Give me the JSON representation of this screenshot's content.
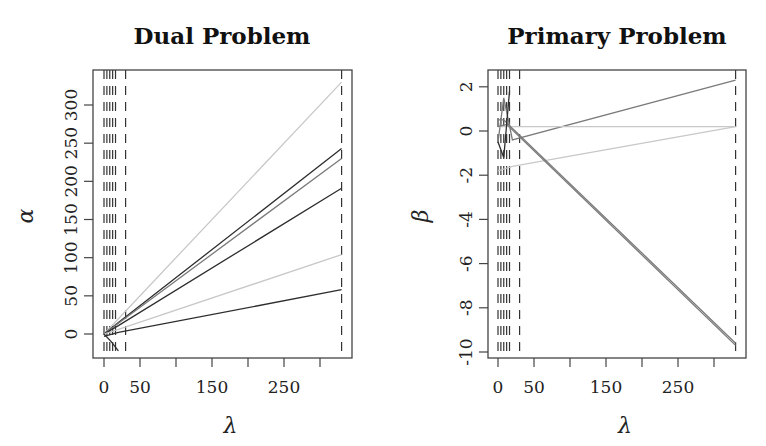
{
  "chart_data": [
    {
      "type": "line",
      "title": "Dual Problem",
      "xlabel": "λ",
      "ylabel": "α",
      "xlim": [
        -15,
        345
      ],
      "ylim": [
        -35,
        345
      ],
      "xticks": [
        0,
        50,
        100,
        150,
        200,
        250,
        300
      ],
      "xtick_labels": [
        "0",
        "50",
        "",
        "150",
        "",
        "250",
        ""
      ],
      "yticks": [
        0,
        50,
        100,
        150,
        200,
        250,
        300
      ],
      "ytick_labels": [
        "0",
        "50",
        "100",
        "150",
        "200",
        "250",
        "300"
      ],
      "grid": false,
      "vlines_dashed": [
        0,
        4,
        8,
        12,
        16,
        30,
        330
      ],
      "series": [
        {
          "name": "path1",
          "shade": "light",
          "x": [
            0,
            20,
            330
          ],
          "y": [
            0,
            20,
            330
          ]
        },
        {
          "name": "path2",
          "shade": "dark",
          "x": [
            0,
            20,
            330
          ],
          "y": [
            0,
            15,
            243
          ]
        },
        {
          "name": "path3",
          "shade": "mid",
          "x": [
            0,
            20,
            330
          ],
          "y": [
            0,
            14,
            230
          ]
        },
        {
          "name": "path4",
          "shade": "dark",
          "x": [
            0,
            20,
            330
          ],
          "y": [
            0,
            11,
            191
          ]
        },
        {
          "name": "path5",
          "shade": "light",
          "x": [
            0,
            20,
            330
          ],
          "y": [
            0,
            6,
            104
          ]
        },
        {
          "name": "path6",
          "shade": "dark",
          "x": [
            0,
            20,
            330
          ],
          "y": [
            -3,
            2,
            58
          ]
        },
        {
          "name": "path7",
          "shade": "dark",
          "x": [
            0,
            10,
            20
          ],
          "y": [
            0,
            -10,
            -22
          ]
        }
      ]
    },
    {
      "type": "line",
      "title": "Primary Problem",
      "xlabel": "λ",
      "ylabel": "β",
      "xlim": [
        -15,
        345
      ],
      "ylim": [
        -10.4,
        2.9
      ],
      "xticks": [
        0,
        50,
        100,
        150,
        200,
        250,
        300
      ],
      "xtick_labels": [
        "0",
        "50",
        "",
        "150",
        "",
        "250",
        ""
      ],
      "yticks": [
        2,
        0,
        -2,
        -4,
        -6,
        -8,
        -10
      ],
      "ytick_labels": [
        "2",
        "0",
        "-2",
        "-4",
        "-6",
        "-8",
        "-10"
      ],
      "grid": false,
      "vlines_dashed": [
        0,
        4,
        8,
        12,
        16,
        30,
        330
      ],
      "series": [
        {
          "name": "beta1",
          "shade": "mid",
          "x": [
            0,
            8,
            20,
            330
          ],
          "y": [
            -0.5,
            1.5,
            -0.4,
            2.3
          ]
        },
        {
          "name": "beta2",
          "shade": "light",
          "x": [
            0,
            20,
            330
          ],
          "y": [
            0.2,
            0.2,
            0.2
          ]
        },
        {
          "name": "beta3",
          "shade": "light",
          "x": [
            0,
            20,
            330
          ],
          "y": [
            -1.8,
            -1.6,
            0.2
          ]
        },
        {
          "name": "beta4",
          "shade": "mid",
          "x": [
            0,
            8,
            330
          ],
          "y": [
            0.5,
            0.5,
            -9.6
          ]
        },
        {
          "name": "beta5",
          "shade": "mid",
          "x": [
            0,
            12,
            330
          ],
          "y": [
            0.2,
            0.3,
            -9.7
          ]
        },
        {
          "name": "beta6",
          "shade": "dark",
          "x": [
            0,
            8,
            16
          ],
          "y": [
            -0.5,
            -1.2,
            1.8
          ]
        }
      ]
    }
  ]
}
